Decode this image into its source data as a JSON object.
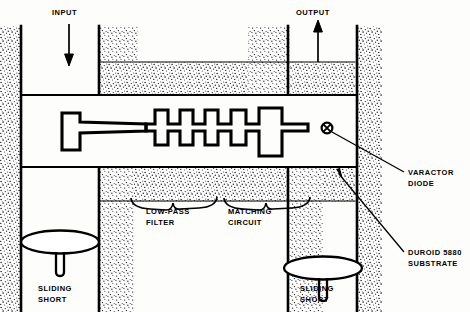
{
  "figure": {
    "type": "technical-cross-section-diagram",
    "background_color": "#fdfdfc",
    "ink_color": "#000000",
    "stipple_color": "#1a1a1a"
  },
  "ports": {
    "input": {
      "label": "INPUT",
      "arrow_direction": "down"
    },
    "output": {
      "label": "OUTPUT",
      "arrow_direction": "up"
    }
  },
  "callouts": {
    "varactor": {
      "label_line1": "VARACTOR",
      "label_line2": "DIODE"
    },
    "substrate": {
      "label_line1": "DUROID 5880",
      "label_line2": "SUBSTRATE"
    }
  },
  "braces": {
    "low_pass_filter": {
      "label_line1": "LOW-PASS",
      "label_line2": "FILTER"
    },
    "matching_circuit": {
      "label_line1": "MATCHING",
      "label_line2": "CIRCUIT"
    }
  },
  "sliding_shorts": [
    {
      "label_line1": "SLIDING",
      "label_line2": "SHORT",
      "side": "left"
    },
    {
      "label_line1": "SLIDING",
      "label_line2": "SHORT",
      "side": "right"
    }
  ],
  "circuit": {
    "description": "Microstrip trace: T-shaped input pad, tapered feed line, five narrow shunt stub pairs forming the low-pass filter, one wide stub pair forming the matching circuit, terminating at the varactor diode",
    "low_pass_filter_stub_pairs": 5,
    "matching_circuit_stub_pairs": 1,
    "varactor_symbol": "small-circle-with-cross"
  }
}
